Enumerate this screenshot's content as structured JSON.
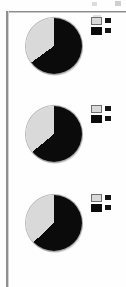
{
  "figure": {
    "background_color": "#fefefe",
    "frame_color": "#8c8c8c",
    "dark_color": "#0b0b0b",
    "light_color": "#d9d9d9"
  },
  "chart_data": [
    {
      "type": "pie",
      "title": "",
      "labels": [
        "Segment A",
        "Segment B"
      ],
      "values": [
        65,
        35
      ],
      "colors": [
        "#0b0b0b",
        "#d9d9d9"
      ],
      "start_angle": 90,
      "direction": "clockwise",
      "legend_position": "right",
      "legend_entries": [
        {
          "label": "",
          "color": "#d9d9d9"
        },
        {
          "label": "",
          "color": "#0b0b0b"
        }
      ]
    },
    {
      "type": "pie",
      "title": "",
      "labels": [
        "Segment A",
        "Segment B"
      ],
      "values": [
        64,
        36
      ],
      "colors": [
        "#0b0b0b",
        "#d9d9d9"
      ],
      "start_angle": 90,
      "direction": "clockwise",
      "legend_position": "right",
      "legend_entries": [
        {
          "label": "",
          "color": "#d9d9d9"
        },
        {
          "label": "",
          "color": "#0b0b0b"
        }
      ]
    },
    {
      "type": "pie",
      "title": "",
      "labels": [
        "Segment A",
        "Segment B"
      ],
      "values": [
        63,
        37
      ],
      "colors": [
        "#0b0b0b",
        "#d9d9d9"
      ],
      "start_angle": 90,
      "direction": "clockwise",
      "legend_position": "right",
      "legend_entries": [
        {
          "label": "",
          "color": "#d9d9d9"
        },
        {
          "label": "",
          "color": "#0b0b0b"
        }
      ]
    }
  ]
}
